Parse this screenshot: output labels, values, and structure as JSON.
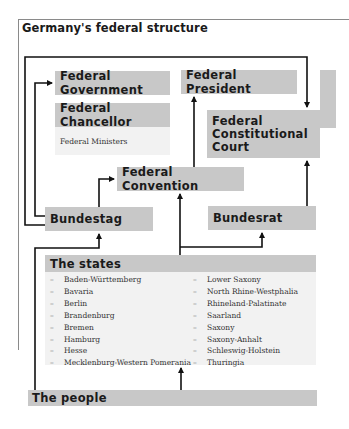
{
  "title": "Germany's federal structure",
  "boxes": {
    "federal_government": "Federal Government",
    "federal_chancellor": "Federal Chancellor",
    "federal_ministers": "Federal Ministers",
    "federal_president": "Federal President",
    "federal_constitutional_court": [
      "Federal",
      "Constitutional",
      "Court"
    ],
    "federal_convention": "Federal Convention",
    "bundestag": "Bundestag",
    "bundesrat": "Bundesrat",
    "the_states": "The states",
    "the_people": "The people"
  },
  "states": {
    "column1": [
      "Baden-Württemberg",
      "Bavaria",
      "Berlin",
      "Brandenburg",
      "Bremen",
      "Hamburg",
      "Hesse",
      "Mecklenburg-Western Pomerania"
    ],
    "column2": [
      "Lower Saxony",
      "North Rhine-Westphalia",
      "Rhineland-Palatinate",
      "Saarland",
      "Saxony",
      "Saxony-Anhalt",
      "Schleswig-Holstein",
      "Thuringia"
    ]
  },
  "list_marker": "–",
  "colors": {
    "box_fill": "#c8c8c8",
    "light_fill": "#f2f2f2",
    "line": "#111111",
    "frame": "#8a8a8a"
  }
}
